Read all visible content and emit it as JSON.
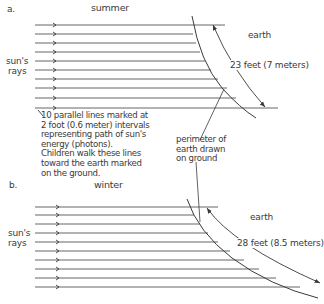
{
  "panel_a": {
    "label": "a.",
    "season": "summer",
    "rays_label_1": "sun's",
    "rays_label_2": "rays",
    "earth_label": "earth",
    "distance_label": "23 feet (7 meters)",
    "note_lines": [
      "10 parallel lines marked at",
      "2 foot (0.6 meter) intervals",
      "representing path of sun's",
      "energy (photons).",
      "Children walk these lines",
      "toward the earth marked",
      "on the ground."
    ]
  },
  "perimeter_note": {
    "lines": [
      "perimeter of",
      "earth drawn",
      "on ground"
    ]
  },
  "panel_b": {
    "label": "b.",
    "season": "winter",
    "rays_label_1": "sun's",
    "rays_label_2": "rays",
    "earth_label": "earth",
    "distance_label": "28 feet (8.5 meters)"
  },
  "colors": {
    "ink": "#3a3a3a",
    "background": "#ffffff"
  }
}
